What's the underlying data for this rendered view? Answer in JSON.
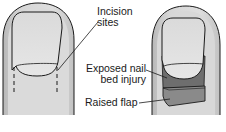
{
  "figure": {
    "panels": [
      {
        "id": "before",
        "description": "fingertip with incision sites marked",
        "annotations": [
          {
            "line1": "Incision",
            "line2": "sites"
          }
        ]
      },
      {
        "id": "after",
        "description": "fingertip with nail flap raised",
        "annotations": [
          {
            "line1": "Exposed nail",
            "line2": "bed injury"
          },
          {
            "line1": "Raised flap"
          }
        ]
      }
    ],
    "colors": {
      "skin": "#c4c4c4",
      "skin_light": "#dcdcdc",
      "nail": "#e2e2e2",
      "lunula": "#ececec",
      "outline": "#1a1a1a",
      "nail_bed_exposed": "#6e6e6e",
      "flap": "#8a8a8a"
    }
  }
}
